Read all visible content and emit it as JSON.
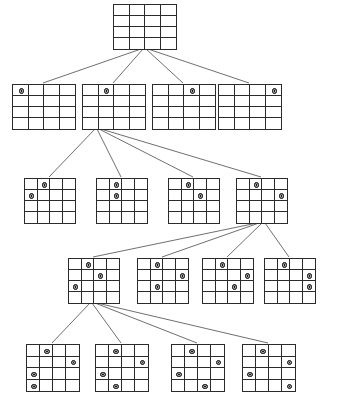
{
  "diagram": {
    "board_size": 4,
    "line_color": "#4a4a4a",
    "grid_color": "#2b2b2b",
    "queen_color": "#1a1a1a",
    "background": "#ffffff"
  },
  "levels": [
    {
      "name": "level-0-root",
      "depth": 0,
      "nodes": [
        {
          "id": "n0",
          "name": "root-empty-board",
          "x": 113,
          "y": 4,
          "w": 62,
          "h": 44,
          "queens": []
        }
      ]
    },
    {
      "name": "level-1",
      "depth": 1,
      "nodes": [
        {
          "id": "n1-0",
          "name": "node-row0-col0",
          "x": 12,
          "y": 84,
          "w": 62,
          "h": 44,
          "queens": [
            [
              0,
              0
            ]
          ]
        },
        {
          "id": "n1-1",
          "name": "node-row0-col1",
          "x": 82,
          "y": 84,
          "w": 62,
          "h": 44,
          "queens": [
            [
              0,
              1
            ]
          ]
        },
        {
          "id": "n1-2",
          "name": "node-row0-col2",
          "x": 152,
          "y": 84,
          "w": 62,
          "h": 44,
          "queens": [
            [
              0,
              2
            ]
          ]
        },
        {
          "id": "n1-3",
          "name": "node-row0-col3",
          "x": 218,
          "y": 84,
          "w": 62,
          "h": 44,
          "queens": [
            [
              0,
              3
            ]
          ]
        }
      ]
    },
    {
      "name": "level-2",
      "depth": 2,
      "nodes": [
        {
          "id": "n2-0",
          "name": "node-row1-col0",
          "x": 24,
          "y": 178,
          "w": 50,
          "h": 44,
          "queens": [
            [
              0,
              1
            ],
            [
              1,
              0
            ]
          ]
        },
        {
          "id": "n2-1",
          "name": "node-row1-col1",
          "x": 96,
          "y": 178,
          "w": 50,
          "h": 44,
          "queens": [
            [
              0,
              1
            ],
            [
              1,
              1
            ]
          ]
        },
        {
          "id": "n2-2",
          "name": "node-row1-col2",
          "x": 168,
          "y": 178,
          "w": 50,
          "h": 44,
          "queens": [
            [
              0,
              1
            ],
            [
              1,
              2
            ]
          ]
        },
        {
          "id": "n2-3",
          "name": "node-row1-col3",
          "x": 236,
          "y": 178,
          "w": 50,
          "h": 44,
          "queens": [
            [
              0,
              1
            ],
            [
              1,
              3
            ]
          ]
        }
      ]
    },
    {
      "name": "level-3",
      "depth": 3,
      "nodes": [
        {
          "id": "n3-0",
          "name": "node-row2-col0",
          "x": 68,
          "y": 258,
          "w": 50,
          "h": 44,
          "queens": [
            [
              0,
              1
            ],
            [
              1,
              2
            ],
            [
              2,
              0
            ]
          ]
        },
        {
          "id": "n3-1",
          "name": "node-row2-col1",
          "x": 137,
          "y": 258,
          "w": 50,
          "h": 44,
          "queens": [
            [
              0,
              1
            ],
            [
              1,
              3
            ],
            [
              2,
              1
            ]
          ]
        },
        {
          "id": "n3-2",
          "name": "node-row2-col2",
          "x": 202,
          "y": 258,
          "w": 50,
          "h": 44,
          "queens": [
            [
              0,
              1
            ],
            [
              1,
              3
            ],
            [
              2,
              2
            ]
          ]
        },
        {
          "id": "n3-3",
          "name": "node-row2-col3",
          "x": 264,
          "y": 258,
          "w": 50,
          "h": 44,
          "queens": [
            [
              0,
              1
            ],
            [
              1,
              3
            ],
            [
              2,
              3
            ]
          ]
        }
      ]
    },
    {
      "name": "level-4",
      "depth": 4,
      "nodes": [
        {
          "id": "n4-0",
          "name": "node-row3-col0",
          "x": 26,
          "y": 344,
          "w": 52,
          "h": 46,
          "queens": [
            [
              0,
              1
            ],
            [
              1,
              3
            ],
            [
              2,
              0
            ],
            [
              3,
              0
            ]
          ]
        },
        {
          "id": "n4-1",
          "name": "node-row3-col1",
          "x": 95,
          "y": 344,
          "w": 52,
          "h": 46,
          "queens": [
            [
              0,
              1
            ],
            [
              1,
              3
            ],
            [
              2,
              0
            ],
            [
              3,
              1
            ]
          ]
        },
        {
          "id": "n4-2",
          "name": "node-row3-col2",
          "x": 171,
          "y": 344,
          "w": 52,
          "h": 46,
          "queens": [
            [
              0,
              1
            ],
            [
              1,
              3
            ],
            [
              2,
              0
            ],
            [
              3,
              2
            ]
          ]
        },
        {
          "id": "n4-3",
          "name": "node-row3-col3",
          "x": 242,
          "y": 344,
          "w": 52,
          "h": 46,
          "queens": [
            [
              0,
              1
            ],
            [
              1,
              3
            ],
            [
              2,
              0
            ],
            [
              3,
              3
            ]
          ]
        }
      ]
    }
  ],
  "edges": [
    {
      "name": "edge-root-to-n1-0",
      "x1": 141,
      "y1": 49,
      "x2": 43,
      "y2": 83
    },
    {
      "name": "edge-root-to-n1-1",
      "x1": 143,
      "y1": 49,
      "x2": 113,
      "y2": 83
    },
    {
      "name": "edge-root-to-n1-2",
      "x1": 146,
      "y1": 49,
      "x2": 183,
      "y2": 83
    },
    {
      "name": "edge-root-to-n1-3",
      "x1": 148,
      "y1": 49,
      "x2": 249,
      "y2": 83
    },
    {
      "name": "edge-n1-1-to-n2-0",
      "x1": 95,
      "y1": 129,
      "x2": 49,
      "y2": 177
    },
    {
      "name": "edge-n1-1-to-n2-1",
      "x1": 97,
      "y1": 129,
      "x2": 121,
      "y2": 177
    },
    {
      "name": "edge-n1-1-to-n2-2",
      "x1": 99,
      "y1": 129,
      "x2": 193,
      "y2": 177
    },
    {
      "name": "edge-n1-1-to-n2-3",
      "x1": 101,
      "y1": 129,
      "x2": 261,
      "y2": 177
    },
    {
      "name": "edge-n2-3-to-n3-0",
      "x1": 257,
      "y1": 223,
      "x2": 93,
      "y2": 257
    },
    {
      "name": "edge-n2-3-to-n3-1",
      "x1": 259,
      "y1": 223,
      "x2": 162,
      "y2": 257
    },
    {
      "name": "edge-n2-3-to-n3-2",
      "x1": 262,
      "y1": 223,
      "x2": 227,
      "y2": 257
    },
    {
      "name": "edge-n2-3-to-n3-3",
      "x1": 265,
      "y1": 223,
      "x2": 289,
      "y2": 257
    },
    {
      "name": "edge-n3-0-to-n4-0",
      "x1": 90,
      "y1": 303,
      "x2": 52,
      "y2": 343
    },
    {
      "name": "edge-n3-0-to-n4-1",
      "x1": 92,
      "y1": 303,
      "x2": 121,
      "y2": 343
    },
    {
      "name": "edge-n3-0-to-n4-2",
      "x1": 95,
      "y1": 303,
      "x2": 197,
      "y2": 343
    },
    {
      "name": "edge-n3-0-to-n4-3",
      "x1": 97,
      "y1": 303,
      "x2": 268,
      "y2": 343
    }
  ]
}
